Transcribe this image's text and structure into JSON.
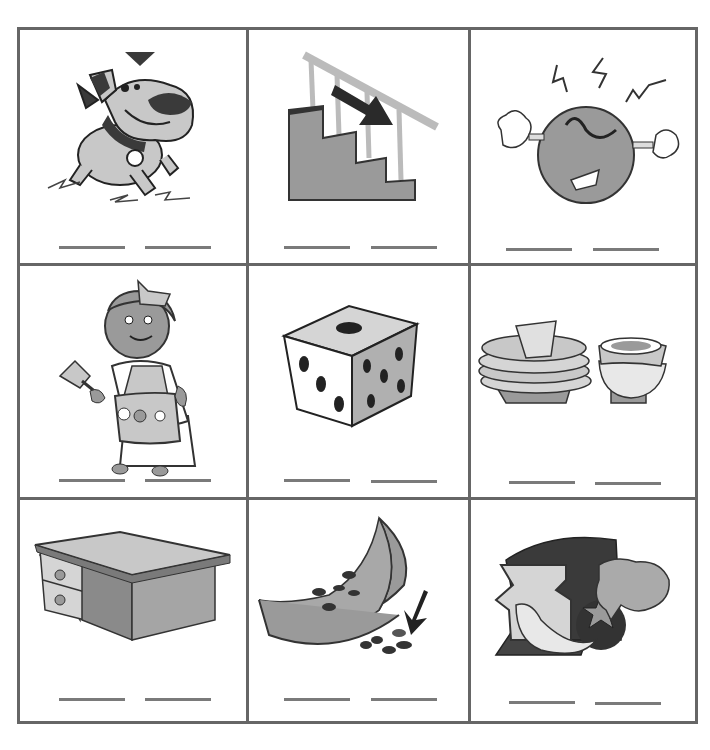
{
  "worksheet": {
    "layout": {
      "rows": 3,
      "cols": 3,
      "blanks_per_cell": 2
    },
    "colors": {
      "grid_line": "#666666",
      "blank_line": "#7a7a7a",
      "fill_light": "#c8c8c8",
      "fill_mid": "#9a9a9a",
      "fill_dark": "#3a3a3a"
    },
    "cells": [
      {
        "picture": "dog",
        "answer_blanks": [
          "",
          ""
        ]
      },
      {
        "picture": "stairs-going-down",
        "answer_blanks": [
          "",
          ""
        ]
      },
      {
        "picture": "angry-face",
        "answer_blanks": [
          "",
          ""
        ]
      },
      {
        "picture": "maid-with-feather-duster",
        "answer_blanks": [
          "",
          ""
        ]
      },
      {
        "picture": "die",
        "answer_blanks": [
          "",
          ""
        ]
      },
      {
        "picture": "dishes",
        "answer_blanks": [
          "",
          ""
        ]
      },
      {
        "picture": "desk",
        "answer_blanks": [
          "",
          ""
        ]
      },
      {
        "picture": "watermelon-seeds",
        "answer_blanks": [
          "",
          ""
        ]
      },
      {
        "picture": "food",
        "answer_blanks": [
          "",
          ""
        ]
      }
    ]
  }
}
